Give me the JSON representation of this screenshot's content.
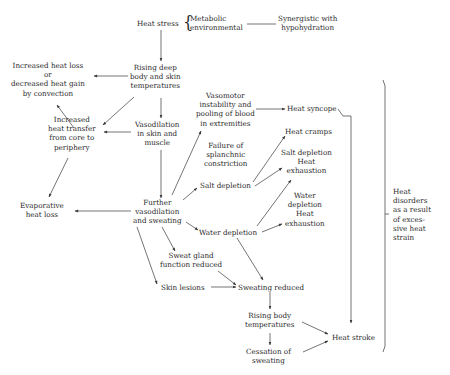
{
  "diagram": {
    "title": "Heat stress",
    "nodes": {
      "heat_stress": {
        "lines": [
          "Heat stress"
        ]
      },
      "sources": {
        "lines": [
          "Metabolic",
          "environmental"
        ]
      },
      "synergistic": {
        "lines": [
          "Synergistic with",
          "hypohydration"
        ]
      },
      "rising_deep": {
        "lines": [
          "Rising deep",
          "body and skin",
          "temperatures"
        ]
      },
      "increased_heat_loss": {
        "lines": [
          "Increased heat loss",
          "or",
          "decreased heat gain",
          "by convection"
        ]
      },
      "increased_transfer": {
        "lines": [
          "Increased",
          "heat transfer",
          "from core to",
          "periphery"
        ]
      },
      "vasodilation": {
        "lines": [
          "Vasodilation",
          "in skin and",
          "muscle"
        ]
      },
      "vasomotor": {
        "lines": [
          "Vasomotor",
          "instability and",
          "pooling of blood",
          "in extremities"
        ]
      },
      "heat_syncope": {
        "lines": [
          "Heat syncope"
        ]
      },
      "heat_cramps": {
        "lines": [
          "Heat cramps"
        ]
      },
      "splanchnic": {
        "lines": [
          "Failure of",
          "splanchnic",
          "constriction"
        ]
      },
      "salt_exhaustion": {
        "lines": [
          "Salt depletion",
          "Heat",
          "exhaustion"
        ]
      },
      "salt_depletion": {
        "lines": [
          "Salt depletion"
        ]
      },
      "water_exhaustion": {
        "lines": [
          "Water",
          "depletion",
          "Heat",
          "exhaustion"
        ]
      },
      "evaporative": {
        "lines": [
          "Evaporative",
          "heat loss"
        ]
      },
      "further_vaso": {
        "lines": [
          "Further",
          "vasodilation",
          "and sweating"
        ]
      },
      "water_depletion": {
        "lines": [
          "Water depletion"
        ]
      },
      "sweat_gland": {
        "lines": [
          "Sweat gland",
          "function reduced"
        ]
      },
      "skin_lesions": {
        "lines": [
          "Skin lesions"
        ]
      },
      "sweating_reduced": {
        "lines": [
          "Sweating reduced"
        ]
      },
      "rising_body": {
        "lines": [
          "Rising body",
          "temperatures"
        ]
      },
      "cessation": {
        "lines": [
          "Cessation of",
          "sweating"
        ]
      },
      "heat_stroke": {
        "lines": [
          "Heat stroke"
        ]
      },
      "heat_disorders": {
        "lines": [
          "Heat",
          "disorders",
          "as a result",
          "of exces-",
          "sive heat",
          "strain"
        ]
      }
    },
    "colors": {
      "line": "#3a3a3a",
      "text": "#2a2a2a",
      "background": "#ffffff"
    }
  }
}
